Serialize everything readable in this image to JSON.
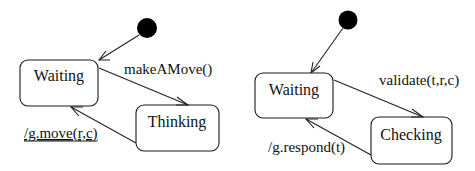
{
  "diagrams": [
    {
      "name": "player-state-machine",
      "initial_state": "Waiting",
      "states": [
        {
          "id": "waiting",
          "label": "Waiting"
        },
        {
          "id": "thinking",
          "label": "Thinking"
        }
      ],
      "transitions": [
        {
          "from": "initial",
          "to": "waiting",
          "label": ""
        },
        {
          "from": "waiting",
          "to": "thinking",
          "label": "makeAMove()"
        },
        {
          "from": "thinking",
          "to": "waiting",
          "label": "/g.move(r,c)",
          "underlined": true
        }
      ]
    },
    {
      "name": "referee-state-machine",
      "initial_state": "Waiting",
      "states": [
        {
          "id": "waiting",
          "label": "Waiting"
        },
        {
          "id": "checking",
          "label": "Checking"
        }
      ],
      "transitions": [
        {
          "from": "initial",
          "to": "waiting",
          "label": ""
        },
        {
          "from": "waiting",
          "to": "checking",
          "label": "validate(t,r,c)"
        },
        {
          "from": "checking",
          "to": "waiting",
          "label": "/g.respond(t)"
        }
      ]
    }
  ],
  "colors": {
    "stroke": "#1a1a1a",
    "initial_node": "#000000",
    "background": "#ffffff"
  }
}
